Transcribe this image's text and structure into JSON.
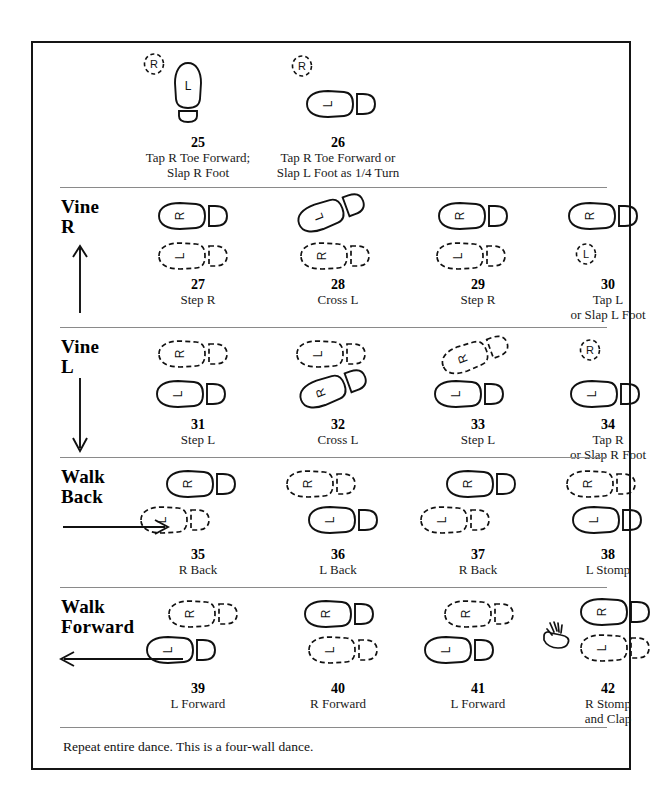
{
  "document": {
    "title": "Line Dance Step Chart (steps 25-42)",
    "footer_note": "Repeat entire dance.  This is a four-wall dance."
  },
  "sections": [
    {
      "id": "intro",
      "label": "",
      "arrow": "none",
      "steps": [
        {
          "number": "25",
          "caption": "Tap R Toe Forward;\nSlap R Foot",
          "marks": [
            {
              "kind": "tap-mark",
              "letter": "R",
              "x": 18,
              "y": 2
            },
            {
              "kind": "foot-vertical-solid",
              "letter": "L",
              "x": 48,
              "y": 12
            }
          ]
        },
        {
          "number": "26",
          "caption": "Tap R Toe Forward or\nSlap L Foot as 1/4 Turn",
          "marks": [
            {
              "kind": "tap-mark",
              "letter": "R",
              "x": 26,
              "y": 4
            },
            {
              "kind": "foot-solid",
              "letter": "L",
              "x": 40,
              "y": 38
            }
          ]
        }
      ]
    },
    {
      "id": "vine-r",
      "label": "Vine\nR",
      "arrow": "up",
      "steps": [
        {
          "number": "27",
          "caption": "Step R",
          "marks": [
            {
              "kind": "foot-solid",
              "letter": "R",
              "x": 32,
              "y": 4
            },
            {
              "kind": "foot-dashed",
              "letter": "L",
              "x": 32,
              "y": 44
            }
          ]
        },
        {
          "number": "28",
          "caption": "Cross L",
          "marks": [
            {
              "kind": "foot-solid-tilted",
              "letter": "L",
              "x": 30,
              "y": 0
            },
            {
              "kind": "foot-dashed",
              "letter": "R",
              "x": 34,
              "y": 44
            }
          ]
        },
        {
          "number": "29",
          "caption": "Step R",
          "marks": [
            {
              "kind": "foot-solid",
              "letter": "R",
              "x": 32,
              "y": 4
            },
            {
              "kind": "foot-dashed",
              "letter": "L",
              "x": 30,
              "y": 44
            }
          ]
        },
        {
          "number": "30",
          "caption": "Tap L\nor Slap L Foot",
          "marks": [
            {
              "kind": "foot-solid",
              "letter": "R",
              "x": 32,
              "y": 4
            },
            {
              "kind": "tap-mark",
              "letter": "L",
              "x": 40,
              "y": 46
            }
          ]
        }
      ]
    },
    {
      "id": "vine-l",
      "label": "Vine\nL",
      "arrow": "down",
      "steps": [
        {
          "number": "31",
          "caption": "Step L",
          "marks": [
            {
              "kind": "foot-dashed",
              "letter": "R",
              "x": 32,
              "y": 2
            },
            {
              "kind": "foot-solid",
              "letter": "L",
              "x": 30,
              "y": 42
            }
          ]
        },
        {
          "number": "32",
          "caption": "Cross L",
          "marks": [
            {
              "kind": "foot-dashed",
              "letter": "L",
              "x": 30,
              "y": 2
            },
            {
              "kind": "foot-solid-tilted",
              "letter": "R",
              "x": 32,
              "y": 36
            }
          ]
        },
        {
          "number": "33",
          "caption": "Step L",
          "marks": [
            {
              "kind": "foot-dashed-tilted",
              "letter": "R",
              "x": 34,
              "y": 2
            },
            {
              "kind": "foot-solid",
              "letter": "L",
              "x": 28,
              "y": 42
            }
          ]
        },
        {
          "number": "34",
          "caption": "Tap R\nor Slap R Foot",
          "marks": [
            {
              "kind": "tap-mark",
              "letter": "R",
              "x": 44,
              "y": 2
            },
            {
              "kind": "foot-solid",
              "letter": "L",
              "x": 34,
              "y": 42
            }
          ]
        }
      ]
    },
    {
      "id": "walk-back",
      "label": "Walk\nBack",
      "arrow": "right",
      "steps": [
        {
          "number": "35",
          "caption": "R Back",
          "marks": [
            {
              "kind": "foot-solid",
              "letter": "R",
              "x": 40,
              "y": 2
            },
            {
              "kind": "foot-dashed",
              "letter": "L",
              "x": 14,
              "y": 38
            }
          ]
        },
        {
          "number": "36",
          "caption": "L Back",
          "marks": [
            {
              "kind": "foot-dashed",
              "letter": "R",
              "x": 20,
              "y": 2
            },
            {
              "kind": "foot-solid",
              "letter": "L",
              "x": 42,
              "y": 38
            }
          ]
        },
        {
          "number": "37",
          "caption": "R Back",
          "marks": [
            {
              "kind": "foot-solid",
              "letter": "R",
              "x": 40,
              "y": 2
            },
            {
              "kind": "foot-dashed",
              "letter": "L",
              "x": 14,
              "y": 38
            }
          ]
        },
        {
          "number": "38",
          "caption": "L Stomp",
          "marks": [
            {
              "kind": "foot-dashed",
              "letter": "R",
              "x": 30,
              "y": 2
            },
            {
              "kind": "foot-solid",
              "letter": "L",
              "x": 36,
              "y": 38
            }
          ]
        }
      ]
    },
    {
      "id": "walk-forward",
      "label": "Walk\nForward",
      "arrow": "left",
      "steps": [
        {
          "number": "39",
          "caption": "L Forward",
          "marks": [
            {
              "kind": "foot-dashed",
              "letter": "R",
              "x": 42,
              "y": 2
            },
            {
              "kind": "foot-solid",
              "letter": "L",
              "x": 20,
              "y": 38
            }
          ]
        },
        {
          "number": "40",
          "caption": "R Forward",
          "marks": [
            {
              "kind": "foot-solid",
              "letter": "R",
              "x": 38,
              "y": 2
            },
            {
              "kind": "foot-dashed",
              "letter": "L",
              "x": 42,
              "y": 38
            }
          ]
        },
        {
          "number": "41",
          "caption": "L Forward",
          "marks": [
            {
              "kind": "foot-dashed",
              "letter": "R",
              "x": 38,
              "y": 2
            },
            {
              "kind": "foot-solid",
              "letter": "L",
              "x": 18,
              "y": 38
            }
          ]
        },
        {
          "number": "42",
          "caption": "R Stomp\nand Clap",
          "marks": [
            {
              "kind": "foot-solid",
              "letter": "R",
              "x": 44,
              "y": 0
            },
            {
              "kind": "clap-hand",
              "letter": "",
              "x": 8,
              "y": 24
            },
            {
              "kind": "foot-dashed",
              "letter": "L",
              "x": 44,
              "y": 36
            }
          ]
        }
      ]
    }
  ],
  "colors": {
    "ink": "#111111",
    "rule": "#8a8a8a",
    "border": "#151515",
    "paper": "#ffffff"
  }
}
